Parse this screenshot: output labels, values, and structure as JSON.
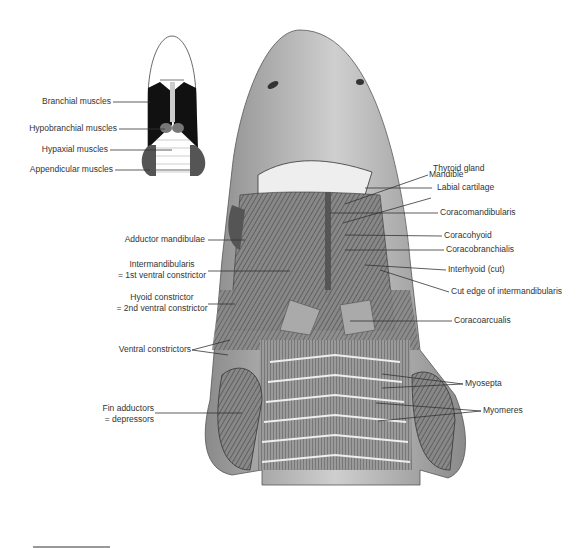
{
  "figure": {
    "inset": {
      "labels": [
        {
          "text": "Branchial muscles"
        },
        {
          "text": "Hypobranchial muscles"
        },
        {
          "text": "Hypaxial muscles"
        },
        {
          "text": "Appendicular muscles"
        }
      ]
    },
    "left_labels": [
      {
        "text": "Adductor mandibulae"
      },
      {
        "line1": "Intermandibularis",
        "line2": "= 1st ventral constrictor"
      },
      {
        "line1": "Hyoid constrictor",
        "line2": "= 2nd ventral constrictor"
      },
      {
        "text": "Ventral constrictors"
      },
      {
        "line1": "Fin adductors",
        "line2": "= depressors"
      }
    ],
    "right_labels": [
      {
        "text": "Mandible"
      },
      {
        "text": "Thyroid gland"
      },
      {
        "text": "Labial cartilage"
      },
      {
        "text": "Coracomandibularis"
      },
      {
        "text": "Coracohyoid"
      },
      {
        "text": "Coracobranchialis"
      },
      {
        "text": "Interhyoid (cut)"
      },
      {
        "text": "Cut edge of intermandibularis"
      },
      {
        "text": "Coracoarcualis"
      },
      {
        "text": "Myosepta"
      },
      {
        "text": "Myomeres"
      }
    ],
    "colors": {
      "ink": "#333333",
      "muscle_dark": "#1a1a1a",
      "skin": "#b8b8b8",
      "background": "#ffffff"
    }
  }
}
